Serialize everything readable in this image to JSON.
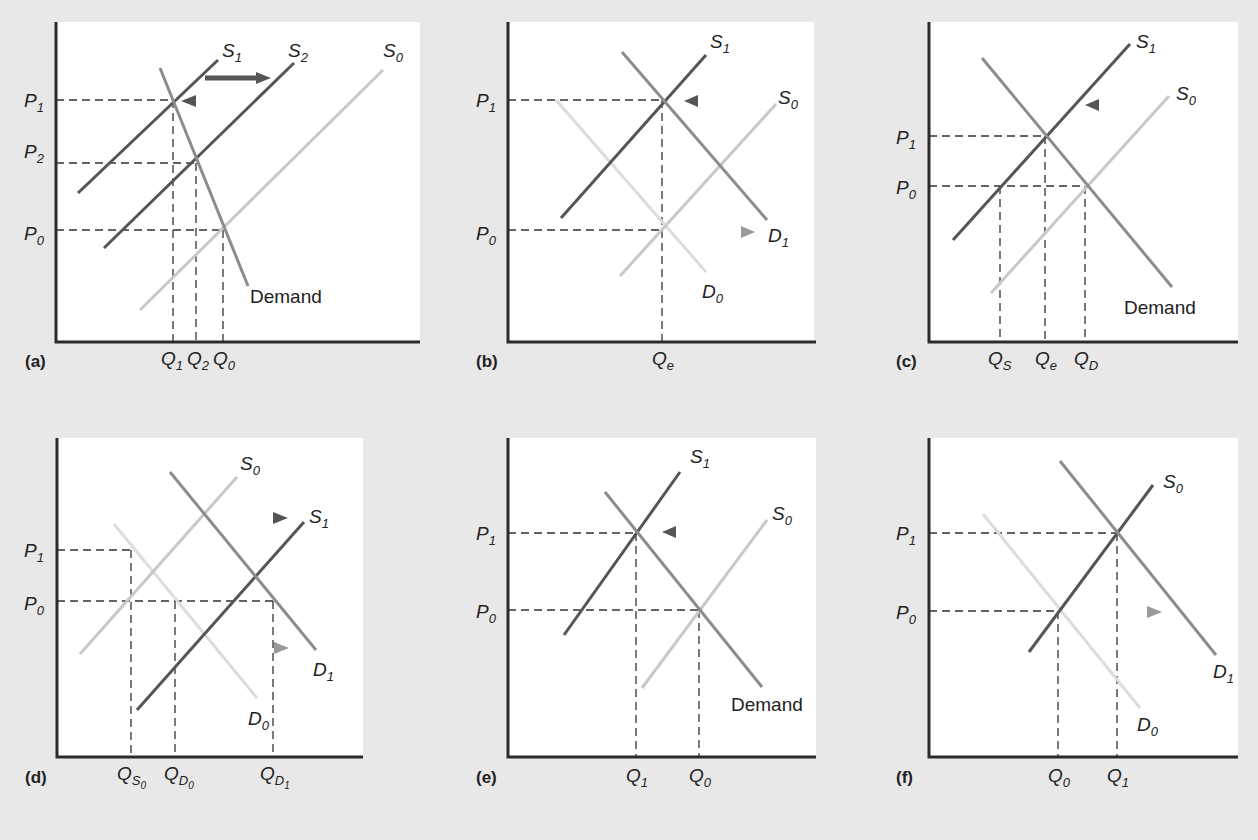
{
  "figure": {
    "colors": {
      "background": "#e8e8e8",
      "plot_background": "#ffffff",
      "axis": "#2b2b2b",
      "new_curve": "#555555",
      "demand_curve": "#8c8c8c",
      "old_curve": "#c8c8c8",
      "faint_curve": "#dcdcdc"
    },
    "panels": [
      {
        "tag": "(a)",
        "curve_labels": {
          "s1": "S",
          "s1_sub": "1",
          "s2": "S",
          "s2_sub": "2",
          "s0": "S",
          "s0_sub": "0",
          "demand": "Demand"
        },
        "price_labels": [
          {
            "p": "P",
            "sub": "1"
          },
          {
            "p": "P",
            "sub": "2"
          },
          {
            "p": "P",
            "sub": "0"
          }
        ],
        "quantity_labels": [
          {
            "q": "Q",
            "sub": "1"
          },
          {
            "q": "Q",
            "sub": "2"
          },
          {
            "q": "Q",
            "sub": "0"
          }
        ]
      },
      {
        "tag": "(b)",
        "curve_labels": {
          "s1": "S",
          "s1_sub": "1",
          "s0": "S",
          "s0_sub": "0",
          "d1": "D",
          "d1_sub": "1",
          "d0": "D",
          "d0_sub": "0"
        },
        "price_labels": [
          {
            "p": "P",
            "sub": "1"
          },
          {
            "p": "P",
            "sub": "0"
          }
        ],
        "quantity_labels": [
          {
            "q": "Q",
            "sub": "e"
          }
        ]
      },
      {
        "tag": "(c)",
        "curve_labels": {
          "s1": "S",
          "s1_sub": "1",
          "s0": "S",
          "s0_sub": "0",
          "demand": "Demand"
        },
        "price_labels": [
          {
            "p": "P",
            "sub": "1"
          },
          {
            "p": "P",
            "sub": "0"
          }
        ],
        "quantity_labels": [
          {
            "q": "Q",
            "sub": "S"
          },
          {
            "q": "Q",
            "sub": "e"
          },
          {
            "q": "Q",
            "sub": "D"
          }
        ]
      },
      {
        "tag": "(d)",
        "curve_labels": {
          "s0": "S",
          "s0_sub": "0",
          "s1": "S",
          "s1_sub": "1",
          "d1": "D",
          "d1_sub": "1",
          "d0": "D",
          "d0_sub": "0"
        },
        "price_labels": [
          {
            "p": "P",
            "sub": "1"
          },
          {
            "p": "P",
            "sub": "0"
          }
        ],
        "quantity_labels": [
          {
            "q": "Q",
            "sub": "S",
            "sub2": "0"
          },
          {
            "q": "Q",
            "sub": "D",
            "sub2": "0"
          },
          {
            "q": "Q",
            "sub": "D",
            "sub2": "1"
          }
        ]
      },
      {
        "tag": "(e)",
        "curve_labels": {
          "s1": "S",
          "s1_sub": "1",
          "s0": "S",
          "s0_sub": "0",
          "demand": "Demand"
        },
        "price_labels": [
          {
            "p": "P",
            "sub": "1"
          },
          {
            "p": "P",
            "sub": "0"
          }
        ],
        "quantity_labels": [
          {
            "q": "Q",
            "sub": "1"
          },
          {
            "q": "Q",
            "sub": "0"
          }
        ]
      },
      {
        "tag": "(f)",
        "curve_labels": {
          "s0": "S",
          "s0_sub": "0",
          "d1": "D",
          "d1_sub": "1",
          "d0": "D",
          "d0_sub": "0"
        },
        "price_labels": [
          {
            "p": "P",
            "sub": "1"
          },
          {
            "p": "P",
            "sub": "0"
          }
        ],
        "quantity_labels": [
          {
            "q": "Q",
            "sub": "0"
          },
          {
            "q": "Q",
            "sub": "1"
          }
        ]
      }
    ]
  }
}
